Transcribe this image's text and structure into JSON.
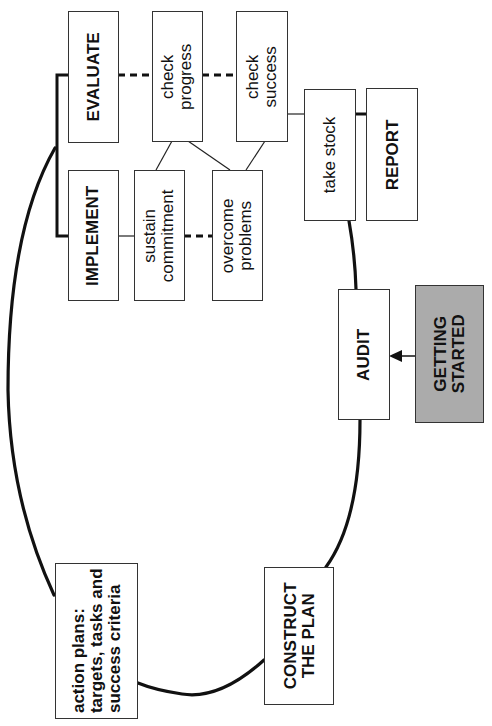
{
  "diagram": {
    "type": "cycle",
    "orientation": "rotated-90-counterclockwise",
    "nodes": [
      {
        "id": "evaluate",
        "label": "EVALUATE",
        "style": "bold"
      },
      {
        "id": "check_progress",
        "label": "check\nprogress",
        "style": "plain"
      },
      {
        "id": "check_success",
        "label": "check\nsuccess",
        "style": "plain"
      },
      {
        "id": "implement",
        "label": "IMPLEMENT",
        "style": "bold"
      },
      {
        "id": "sustain_commitment",
        "label": "sustain\ncommitment",
        "style": "plain"
      },
      {
        "id": "overcome_problems",
        "label": "overcome\nproblems",
        "style": "plain"
      },
      {
        "id": "take_stock",
        "label": "take stock",
        "style": "plain"
      },
      {
        "id": "report",
        "label": "REPORT",
        "style": "bold"
      },
      {
        "id": "audit",
        "label": "AUDIT",
        "style": "bold"
      },
      {
        "id": "getting_started",
        "label": "GETTING\nSTARTED",
        "style": "bold-shaded"
      },
      {
        "id": "action_plans",
        "label": "action plans:\ntargets, tasks and\nsuccess criteria",
        "style": "bold"
      },
      {
        "id": "construct_plan",
        "label": "CONSTRUCT\nTHE PLAN",
        "style": "bold"
      }
    ],
    "edges": [
      {
        "from": "getting_started",
        "to": "audit",
        "type": "arrow"
      },
      {
        "from": "audit",
        "to": "construct_plan",
        "type": "cycle-curve"
      },
      {
        "from": "construct_plan",
        "to": "action_plans",
        "type": "cycle-curve"
      },
      {
        "from": "action_plans",
        "to": "implement",
        "type": "cycle-curve"
      },
      {
        "from": "implement",
        "to": "evaluate",
        "type": "bracket-thick"
      },
      {
        "from": "evaluate",
        "to": "check_progress",
        "type": "dashed-thick"
      },
      {
        "from": "check_progress",
        "to": "check_success",
        "type": "dashed-thick"
      },
      {
        "from": "implement",
        "to": "sustain_commitment",
        "type": "thin"
      },
      {
        "from": "sustain_commitment",
        "to": "overcome_problems",
        "type": "dashed-thick"
      },
      {
        "from": "check_progress",
        "to": "sustain_commitment",
        "type": "thin"
      },
      {
        "from": "check_progress",
        "to": "overcome_problems",
        "type": "thin"
      },
      {
        "from": "check_success",
        "to": "overcome_problems",
        "type": "thin"
      },
      {
        "from": "check_success",
        "to": "take_stock",
        "type": "thin"
      },
      {
        "from": "take_stock",
        "to": "report",
        "type": "thick"
      },
      {
        "from": "take_stock",
        "to": "audit",
        "type": "cycle-curve"
      }
    ]
  },
  "labels": {
    "evaluate": "EVALUATE",
    "check_progress": "check\nprogress",
    "check_success": "check\nsuccess",
    "implement": "IMPLEMENT",
    "sustain_commitment": "sustain\ncommitment",
    "overcome_problems": "overcome\nproblems",
    "take_stock": "take stock",
    "report": "REPORT",
    "audit": "AUDIT",
    "getting_started": "GETTING\nSTARTED",
    "action_plans": "action plans:\ntargets, tasks and\nsuccess criteria",
    "construct_plan": "CONSTRUCT\nTHE PLAN"
  },
  "colors": {
    "stroke": "#111111",
    "box_border": "#333333",
    "shaded_fill": "#c8c8c8",
    "background": "#ffffff"
  }
}
